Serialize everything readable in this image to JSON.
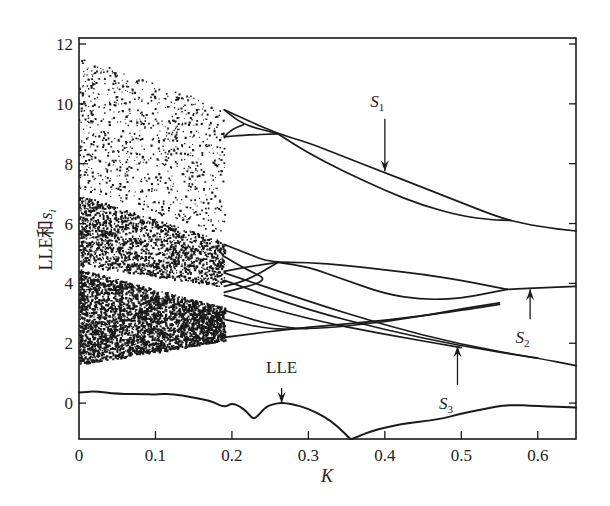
{
  "chart_data": {
    "type": "scatter",
    "title": "",
    "xlabel": "K",
    "ylabel": "LLE和s_i",
    "ylabel_main": "LLE和",
    "ylabel_var": "s",
    "ylabel_sub": "i",
    "xlim": [
      0,
      0.65
    ],
    "ylim": [
      -1.2,
      12.2
    ],
    "x_ticks": [
      0,
      0.1,
      0.2,
      0.3,
      0.4,
      0.5,
      0.6
    ],
    "x_tick_labels": [
      "0",
      "0.1",
      "0.2",
      "0.3",
      "0.4",
      "0.5",
      "0.6"
    ],
    "y_ticks": [
      0,
      2,
      4,
      6,
      8,
      10,
      12
    ],
    "y_tick_labels": [
      "0",
      "2",
      "4",
      "6",
      "8",
      "10",
      "12"
    ],
    "grid": false,
    "legend": null,
    "chaotic_region": {
      "description": "dense scattered points for K in [0, ~0.19]",
      "k_range": [
        0,
        0.19
      ],
      "upper_band": {
        "y_top_at_k0": 11.6,
        "y_top_at_kend": 9.9,
        "y_bottom_at_k0": 7.2,
        "y_bottom_at_kend": 5.6,
        "density": "sparse"
      },
      "middle_band": {
        "y_top_at_k0": 7.0,
        "y_top_at_kend": 5.4,
        "y_bottom_at_k0": 4.6,
        "y_bottom_at_kend": 3.9,
        "density": "dense"
      },
      "lower_band": {
        "y_top_at_k0": 4.5,
        "y_top_at_kend": 3.2,
        "y_bottom_at_k0": 1.3,
        "y_bottom_at_kend": 2.1,
        "density": "very dense"
      }
    },
    "series": [
      {
        "name": "S1 upper branch",
        "points": [
          [
            0.19,
            9.8
          ],
          [
            0.22,
            9.45
          ],
          [
            0.26,
            9.0
          ],
          [
            0.3,
            8.7
          ],
          [
            0.35,
            8.2
          ],
          [
            0.4,
            7.7
          ],
          [
            0.45,
            7.2
          ],
          [
            0.5,
            6.7
          ],
          [
            0.54,
            6.3
          ],
          [
            0.565,
            6.1
          ]
        ]
      },
      {
        "name": "S1 lower branch",
        "points": [
          [
            0.26,
            9.0
          ],
          [
            0.3,
            8.35
          ],
          [
            0.35,
            7.7
          ],
          [
            0.4,
            7.1
          ],
          [
            0.45,
            6.6
          ],
          [
            0.5,
            6.25
          ],
          [
            0.54,
            6.12
          ],
          [
            0.565,
            6.1
          ]
        ]
      },
      {
        "name": "S1 merged",
        "points": [
          [
            0.565,
            6.1
          ],
          [
            0.6,
            5.9
          ],
          [
            0.65,
            5.75
          ]
        ]
      },
      {
        "name": "S1 inner loop upper",
        "points": [
          [
            0.19,
            9.8
          ],
          [
            0.215,
            9.3
          ],
          [
            0.26,
            9.0
          ]
        ]
      },
      {
        "name": "S1 inner loop lower",
        "points": [
          [
            0.19,
            8.9
          ],
          [
            0.215,
            8.95
          ],
          [
            0.26,
            9.0
          ]
        ]
      },
      {
        "name": "S1 spur",
        "points": [
          [
            0.19,
            8.9
          ],
          [
            0.2,
            9.15
          ],
          [
            0.215,
            9.3
          ]
        ]
      },
      {
        "name": "S2 upper branch",
        "points": [
          [
            0.19,
            5.3
          ],
          [
            0.22,
            5.0
          ],
          [
            0.25,
            4.7
          ],
          [
            0.3,
            4.7
          ],
          [
            0.35,
            4.6
          ],
          [
            0.4,
            4.45
          ],
          [
            0.45,
            4.3
          ],
          [
            0.5,
            4.1
          ],
          [
            0.54,
            3.9
          ],
          [
            0.56,
            3.8
          ]
        ]
      },
      {
        "name": "S2 lower branch",
        "points": [
          [
            0.26,
            4.7
          ],
          [
            0.3,
            4.55
          ],
          [
            0.35,
            4.1
          ],
          [
            0.4,
            3.65
          ],
          [
            0.45,
            3.45
          ],
          [
            0.5,
            3.5
          ],
          [
            0.54,
            3.7
          ],
          [
            0.56,
            3.8
          ]
        ]
      },
      {
        "name": "S2 merged",
        "points": [
          [
            0.56,
            3.8
          ],
          [
            0.6,
            3.85
          ],
          [
            0.65,
            3.9
          ]
        ]
      },
      {
        "name": "S2 left loops a",
        "points": [
          [
            0.19,
            4.4
          ],
          [
            0.22,
            4.55
          ],
          [
            0.26,
            4.7
          ]
        ]
      },
      {
        "name": "S2 left loops b",
        "points": [
          [
            0.19,
            3.9
          ],
          [
            0.22,
            4.1
          ],
          [
            0.26,
            4.7
          ]
        ]
      },
      {
        "name": "S2 left loops c",
        "points": [
          [
            0.19,
            4.9
          ],
          [
            0.22,
            4.45
          ],
          [
            0.25,
            4.1
          ],
          [
            0.19,
            3.7
          ]
        ]
      },
      {
        "name": "S3 line a",
        "points": [
          [
            0.19,
            4.35
          ],
          [
            0.3,
            3.4
          ],
          [
            0.4,
            2.6
          ],
          [
            0.5,
            1.95
          ],
          [
            0.6,
            1.5
          ],
          [
            0.65,
            1.25
          ]
        ]
      },
      {
        "name": "S3 line b",
        "points": [
          [
            0.19,
            4.1
          ],
          [
            0.3,
            3.1
          ],
          [
            0.4,
            2.45
          ],
          [
            0.5,
            1.9
          ],
          [
            0.6,
            1.5
          ]
        ]
      },
      {
        "name": "S3 line c",
        "points": [
          [
            0.19,
            3.6
          ],
          [
            0.3,
            2.8
          ],
          [
            0.4,
            2.3
          ],
          [
            0.5,
            1.85
          ]
        ]
      },
      {
        "name": "S3 crossing d",
        "points": [
          [
            0.19,
            2.2
          ],
          [
            0.3,
            2.55
          ],
          [
            0.4,
            2.75
          ],
          [
            0.5,
            3.1
          ],
          [
            0.55,
            3.3
          ]
        ]
      },
      {
        "name": "S3 crossing e",
        "points": [
          [
            0.19,
            3.1
          ],
          [
            0.25,
            2.6
          ],
          [
            0.3,
            2.45
          ],
          [
            0.4,
            2.7
          ],
          [
            0.5,
            3.15
          ],
          [
            0.55,
            3.35
          ]
        ]
      },
      {
        "name": "S3 crossing f",
        "points": [
          [
            0.19,
            2.8
          ],
          [
            0.25,
            2.45
          ],
          [
            0.3,
            2.5
          ]
        ]
      },
      {
        "name": "LLE",
        "points": [
          [
            0,
            0.35
          ],
          [
            0.02,
            0.4
          ],
          [
            0.05,
            0.3
          ],
          [
            0.09,
            0.3
          ],
          [
            0.1,
            0.28
          ],
          [
            0.12,
            0.32
          ],
          [
            0.15,
            0.18
          ],
          [
            0.175,
            0.05
          ],
          [
            0.19,
            -0.15
          ],
          [
            0.2,
            0.0
          ],
          [
            0.21,
            -0.1
          ],
          [
            0.22,
            -0.3
          ],
          [
            0.228,
            -0.55
          ],
          [
            0.235,
            -0.4
          ],
          [
            0.245,
            -0.1
          ],
          [
            0.26,
            0.0
          ],
          [
            0.27,
            0.0
          ],
          [
            0.29,
            -0.1
          ],
          [
            0.31,
            -0.3
          ],
          [
            0.33,
            -0.6
          ],
          [
            0.345,
            -0.95
          ],
          [
            0.355,
            -1.2
          ]
        ]
      },
      {
        "name": "LLE right",
        "points": [
          [
            0.357,
            -1.2
          ],
          [
            0.38,
            -0.95
          ],
          [
            0.42,
            -0.7
          ],
          [
            0.47,
            -0.55
          ],
          [
            0.5,
            -0.35
          ],
          [
            0.53,
            -0.2
          ],
          [
            0.56,
            -0.05
          ],
          [
            0.6,
            -0.1
          ],
          [
            0.65,
            -0.15
          ]
        ]
      }
    ],
    "annotations": [
      {
        "text_main": "S",
        "text_sub": "1",
        "label_xy": [
          0.39,
          9.9
        ],
        "arrow_from": [
          0.4,
          9.5
        ],
        "arrow_to": [
          0.4,
          7.75
        ]
      },
      {
        "text_main": "S",
        "text_sub": "2",
        "label_xy": [
          0.58,
          2.0
        ],
        "arrow_from": [
          0.59,
          2.8
        ],
        "arrow_to": [
          0.59,
          3.8
        ]
      },
      {
        "text_main": "S",
        "text_sub": "3",
        "label_xy": [
          0.48,
          -0.2
        ],
        "arrow_from": [
          0.495,
          0.6
        ],
        "arrow_to": [
          0.495,
          1.9
        ]
      },
      {
        "text_main": "LLE",
        "text_sub": "",
        "label_xy": [
          0.265,
          1.0
        ],
        "arrow_from": [
          0.265,
          0.5
        ],
        "arrow_to": [
          0.265,
          0.0
        ]
      }
    ]
  },
  "colors": {
    "ink": "#1a1a1a",
    "background": "#ffffff"
  }
}
